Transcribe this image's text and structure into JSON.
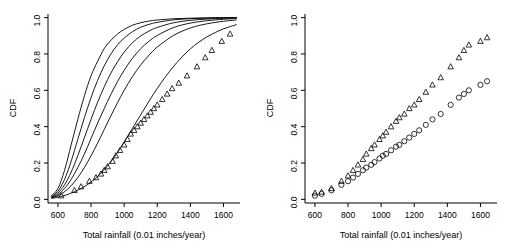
{
  "figure": {
    "panels": [
      {
        "name": "left-panel",
        "xlabel": "Total rainfall (0.01 inches/year)",
        "ylabel": "CDF",
        "xticks": [
          600,
          800,
          1000,
          1200,
          1400,
          1600
        ],
        "yticks": [
          "0.0",
          "0.2",
          "0.4",
          "0.6",
          "0.8",
          "1.0"
        ],
        "xlim": [
          540,
          1700
        ],
        "ylim": [
          -0.02,
          1.02
        ]
      },
      {
        "name": "right-panel",
        "xlabel": "Total rainfall (0.01 inches/year)",
        "ylabel": "CDF",
        "xticks": [
          600,
          800,
          1000,
          1200,
          1400,
          1600
        ],
        "yticks": [
          "0.0",
          "0.2",
          "0.4",
          "0.6",
          "0.8",
          "1.0"
        ],
        "xlim": [
          540,
          1700
        ],
        "ylim": [
          -0.02,
          1.02
        ]
      }
    ]
  },
  "chart_data": [
    {
      "type": "line",
      "title": "",
      "xlabel": "Total rainfall (0.01 inches/year)",
      "ylabel": "CDF",
      "xlim": [
        540,
        1700
      ],
      "ylim": [
        -0.02,
        1.02
      ],
      "xticks": [
        600,
        800,
        1000,
        1200,
        1400,
        1600
      ],
      "yticks": [
        0.0,
        0.2,
        0.4,
        0.6,
        0.8,
        1.0
      ],
      "grid": false,
      "legend": "none",
      "series": [
        {
          "name": "cdf-curve-1",
          "style": "solid-black-line",
          "x": [
            560,
            600,
            640,
            680,
            720,
            760,
            800,
            840,
            880,
            920,
            960,
            1000,
            1050,
            1100,
            1150,
            1200,
            1300,
            1400,
            1500,
            1600,
            1680
          ],
          "values": [
            0.02,
            0.06,
            0.16,
            0.3,
            0.44,
            0.57,
            0.68,
            0.76,
            0.83,
            0.875,
            0.91,
            0.935,
            0.958,
            0.972,
            0.981,
            0.987,
            0.994,
            0.997,
            0.999,
            1.0,
            1.0
          ]
        },
        {
          "name": "cdf-curve-2",
          "style": "solid-black-line",
          "x": [
            560,
            600,
            640,
            680,
            720,
            760,
            800,
            840,
            880,
            920,
            960,
            1000,
            1050,
            1100,
            1150,
            1200,
            1300,
            1400,
            1500,
            1600,
            1680
          ],
          "values": [
            0.015,
            0.045,
            0.11,
            0.21,
            0.33,
            0.45,
            0.56,
            0.655,
            0.735,
            0.8,
            0.85,
            0.887,
            0.923,
            0.947,
            0.963,
            0.974,
            0.988,
            0.994,
            0.997,
            0.999,
            1.0
          ]
        },
        {
          "name": "cdf-curve-3",
          "style": "solid-black-line",
          "x": [
            560,
            600,
            640,
            680,
            720,
            760,
            800,
            840,
            880,
            920,
            960,
            1000,
            1050,
            1100,
            1150,
            1200,
            1300,
            1400,
            1500,
            1600,
            1680
          ],
          "values": [
            0.012,
            0.035,
            0.08,
            0.15,
            0.24,
            0.34,
            0.44,
            0.535,
            0.62,
            0.695,
            0.757,
            0.81,
            0.862,
            0.899,
            0.926,
            0.946,
            0.972,
            0.985,
            0.992,
            0.996,
            0.998
          ]
        },
        {
          "name": "cdf-curve-4",
          "style": "solid-black-line",
          "x": [
            560,
            600,
            640,
            680,
            720,
            760,
            800,
            840,
            880,
            920,
            960,
            1000,
            1050,
            1100,
            1150,
            1200,
            1300,
            1400,
            1500,
            1600,
            1680
          ],
          "values": [
            0.01,
            0.027,
            0.06,
            0.11,
            0.175,
            0.25,
            0.335,
            0.42,
            0.5,
            0.578,
            0.648,
            0.71,
            0.776,
            0.829,
            0.87,
            0.902,
            0.946,
            0.97,
            0.983,
            0.991,
            0.995
          ]
        },
        {
          "name": "cdf-curve-5",
          "style": "solid-black-line",
          "x": [
            560,
            600,
            640,
            680,
            720,
            760,
            800,
            840,
            880,
            920,
            960,
            1000,
            1050,
            1100,
            1150,
            1200,
            1300,
            1400,
            1500,
            1600,
            1680
          ],
          "values": [
            0.008,
            0.02,
            0.042,
            0.075,
            0.12,
            0.175,
            0.24,
            0.31,
            0.385,
            0.46,
            0.532,
            0.6,
            0.675,
            0.74,
            0.793,
            0.838,
            0.903,
            0.943,
            0.966,
            0.98,
            0.987
          ]
        },
        {
          "name": "cdf-curve-6-lower",
          "style": "solid-black-line",
          "x": [
            560,
            600,
            650,
            700,
            750,
            800,
            850,
            900,
            950,
            1000,
            1050,
            1100,
            1150,
            1200,
            1250,
            1300,
            1350,
            1400,
            1450,
            1500,
            1550,
            1600,
            1680
          ],
          "values": [
            0.005,
            0.012,
            0.024,
            0.042,
            0.065,
            0.095,
            0.135,
            0.185,
            0.245,
            0.315,
            0.39,
            0.465,
            0.54,
            0.61,
            0.675,
            0.733,
            0.784,
            0.828,
            0.864,
            0.894,
            0.918,
            0.938,
            0.962
          ]
        },
        {
          "name": "empirical-triangles",
          "style": "open-triangle-markers",
          "x": [
            620,
            700,
            740,
            790,
            830,
            860,
            880,
            900,
            930,
            950,
            975,
            1000,
            1020,
            1040,
            1060,
            1080,
            1100,
            1120,
            1140,
            1160,
            1180,
            1200,
            1230,
            1260,
            1290,
            1330,
            1380,
            1440,
            1490,
            1530,
            1590,
            1640
          ],
          "values": [
            0.02,
            0.05,
            0.07,
            0.1,
            0.12,
            0.14,
            0.16,
            0.18,
            0.21,
            0.24,
            0.27,
            0.3,
            0.33,
            0.36,
            0.38,
            0.4,
            0.42,
            0.44,
            0.46,
            0.48,
            0.5,
            0.52,
            0.55,
            0.58,
            0.61,
            0.64,
            0.68,
            0.73,
            0.78,
            0.82,
            0.87,
            0.91
          ]
        }
      ]
    },
    {
      "type": "scatter",
      "title": "",
      "xlabel": "Total rainfall (0.01 inches/year)",
      "ylabel": "CDF",
      "xlim": [
        540,
        1700
      ],
      "ylim": [
        -0.02,
        1.02
      ],
      "xticks": [
        600,
        800,
        1000,
        1200,
        1400,
        1600
      ],
      "yticks": [
        0.0,
        0.2,
        0.4,
        0.6,
        0.8,
        1.0
      ],
      "grid": false,
      "legend": "none",
      "series": [
        {
          "name": "triangle-series",
          "style": "open-triangle-markers",
          "x": [
            600,
            640,
            700,
            760,
            800,
            830,
            860,
            890,
            910,
            940,
            960,
            990,
            1010,
            1030,
            1060,
            1090,
            1110,
            1140,
            1170,
            1200,
            1230,
            1270,
            1310,
            1360,
            1420,
            1470,
            1500,
            1530,
            1600,
            1640
          ],
          "values": [
            0.035,
            0.04,
            0.06,
            0.1,
            0.13,
            0.16,
            0.19,
            0.22,
            0.25,
            0.28,
            0.3,
            0.33,
            0.35,
            0.37,
            0.4,
            0.43,
            0.45,
            0.47,
            0.5,
            0.52,
            0.55,
            0.59,
            0.63,
            0.67,
            0.73,
            0.78,
            0.82,
            0.85,
            0.87,
            0.89
          ]
        },
        {
          "name": "circle-series",
          "style": "open-circle-markers",
          "x": [
            600,
            640,
            700,
            760,
            800,
            830,
            860,
            890,
            910,
            940,
            960,
            990,
            1010,
            1030,
            1060,
            1090,
            1110,
            1140,
            1170,
            1200,
            1230,
            1270,
            1310,
            1360,
            1420,
            1470,
            1500,
            1530,
            1600,
            1640
          ],
          "values": [
            0.02,
            0.03,
            0.05,
            0.08,
            0.1,
            0.12,
            0.14,
            0.16,
            0.175,
            0.19,
            0.205,
            0.225,
            0.24,
            0.25,
            0.27,
            0.29,
            0.3,
            0.32,
            0.34,
            0.36,
            0.38,
            0.41,
            0.44,
            0.47,
            0.52,
            0.56,
            0.58,
            0.6,
            0.63,
            0.65
          ]
        }
      ]
    }
  ]
}
